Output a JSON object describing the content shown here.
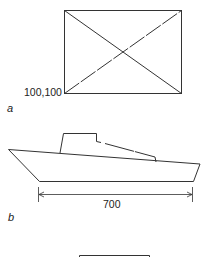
{
  "figure": {
    "panels": [
      {
        "id": "a",
        "label": "a",
        "origin_label": "100,100",
        "shape": "rectangle-with-diagonals"
      },
      {
        "id": "b",
        "label": "b",
        "dimension_label": "700",
        "shape": "boat-outline"
      }
    ],
    "stroke_color": "#333333"
  }
}
